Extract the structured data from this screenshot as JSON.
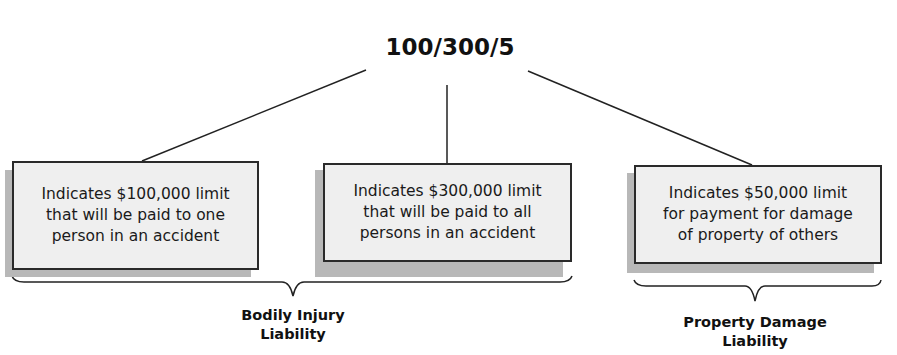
{
  "title": "100/300/5",
  "boxes": [
    {
      "lines": [
        "Indicates $100,000 limit",
        "that will be paid to one",
        "person in an accident"
      ]
    },
    {
      "lines": [
        "Indicates $300,000 limit",
        "that will be paid to all",
        "persons in an accident"
      ]
    },
    {
      "lines": [
        "Indicates $50,000 limit",
        "for payment for damage",
        "of property of others"
      ]
    }
  ],
  "groups": [
    {
      "lines": [
        "Bodily Injury",
        "Liability"
      ]
    },
    {
      "lines": [
        "Property Damage",
        "Liability"
      ]
    }
  ],
  "colors": {
    "box_fill": "#efefef",
    "box_border": "#2a2a2a",
    "shadow": "#b8b8b8",
    "line": "#222222"
  }
}
